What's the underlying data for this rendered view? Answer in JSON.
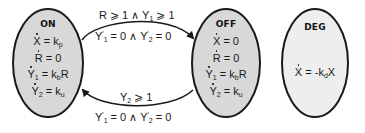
{
  "diagram": {
    "colors": {
      "state_fill": "#d8d8d8",
      "deg_fill": "#eeeeee",
      "stroke": "#1a1a1a",
      "background": "#ffffff"
    },
    "states": [
      {
        "id": "on",
        "title": "ON",
        "equations": [
          {
            "lhs": "X",
            "rhs": "= k",
            "sub": "p",
            "tail": ""
          },
          {
            "lhs": "R",
            "rhs": "= 0",
            "sub": "",
            "tail": ""
          },
          {
            "lhs": "Y",
            "lhs_sub": "1",
            "rhs": "= k",
            "sub": "b",
            "tail": "R"
          },
          {
            "lhs": "Y",
            "lhs_sub": "2",
            "rhs": "= k",
            "sub": "u",
            "tail": ""
          }
        ]
      },
      {
        "id": "off",
        "title": "OFF",
        "equations": [
          {
            "lhs": "X",
            "rhs": "= 0",
            "sub": "",
            "tail": ""
          },
          {
            "lhs": "R",
            "rhs": "= 0",
            "sub": "",
            "tail": ""
          },
          {
            "lhs": "Y",
            "lhs_sub": "1",
            "rhs": "= k",
            "sub": "b",
            "tail": "R"
          },
          {
            "lhs": "Y",
            "lhs_sub": "2",
            "rhs": "= k",
            "sub": "u",
            "tail": ""
          }
        ]
      },
      {
        "id": "deg",
        "title": "DEG",
        "equations": [
          {
            "lhs": "X",
            "rhs": "= -k",
            "sub": "d",
            "tail": "X"
          }
        ]
      }
    ],
    "transitions": [
      {
        "from": "ON",
        "to": "OFF",
        "guard": {
          "a": "R ⩾ 1 ∧ Y",
          "a_sub": "1",
          "b": " ⩾ 1"
        },
        "reset": {
          "y1": "Y",
          "y1_sub": "1",
          "eq1": " = 0 ∧ Y",
          "y2_sub": "2",
          "eq2": " = 0"
        }
      },
      {
        "from": "OFF",
        "to": "ON",
        "guard": {
          "a": "Y",
          "a_sub": "2",
          "b": " ⩾ 1"
        },
        "reset": {
          "y1": "Y",
          "y1_sub": "1",
          "eq1": " = 0 ∧ Y",
          "y2_sub": "2",
          "eq2": " = 0"
        }
      }
    ]
  }
}
